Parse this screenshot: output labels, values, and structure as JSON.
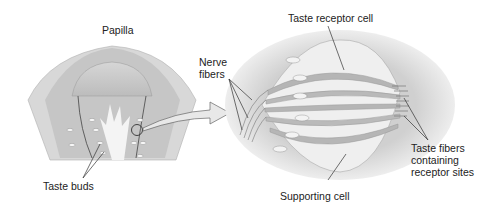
{
  "diagram": {
    "type": "anatomical-illustration",
    "labels": {
      "papilla": "Papilla",
      "taste_buds": "Taste buds",
      "nerve_fibers_line1": "Nerve",
      "nerve_fibers_line2": "fibers",
      "taste_receptor_cell": "Taste receptor cell",
      "supporting_cell": "Supporting cell",
      "taste_fibers_line1": "Taste fibers",
      "taste_fibers_line2": "containing",
      "taste_fibers_line3": "receptor sites"
    },
    "colors": {
      "background": "#ffffff",
      "tissue_light": "#e4e4e4",
      "tissue_mid": "#c8c8c8",
      "tissue_dark": "#a8a8a8",
      "receptor_cell": "#b5b5b5",
      "supporting_cell": "#e8e8e8",
      "line": "#333333"
    }
  }
}
